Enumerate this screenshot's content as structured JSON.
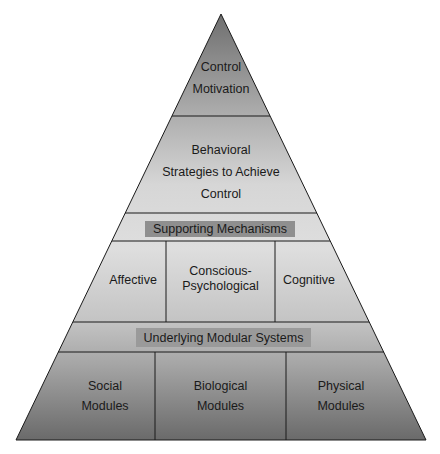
{
  "diagram": {
    "type": "pyramid",
    "levels": [
      {
        "id": "apex",
        "lines": [
          "Control",
          "Motivation"
        ]
      },
      {
        "id": "strategies",
        "lines": [
          "Behavioral",
          "Strategies to Achieve",
          "Control"
        ]
      },
      {
        "id": "supporting_header",
        "label": "Supporting Mechanisms"
      },
      {
        "id": "supporting",
        "cells": [
          {
            "lines": [
              "Affective"
            ]
          },
          {
            "lines": [
              "Conscious-",
              "Psychological"
            ]
          },
          {
            "lines": [
              "Cognitive"
            ]
          }
        ]
      },
      {
        "id": "modular_header",
        "label": "Underlying Modular Systems"
      },
      {
        "id": "modules",
        "cells": [
          {
            "lines": [
              "Social",
              "Modules"
            ]
          },
          {
            "lines": [
              "Biological",
              "Modules"
            ]
          },
          {
            "lines": [
              "Physical",
              "Modules"
            ]
          }
        ]
      }
    ],
    "colors": {
      "apex_fill": "#8c8c8c",
      "light_fill": "#d9d9d9",
      "base_fill": "#707070",
      "label_box": "#8f8f8f",
      "line": "#1a1a1a"
    }
  }
}
